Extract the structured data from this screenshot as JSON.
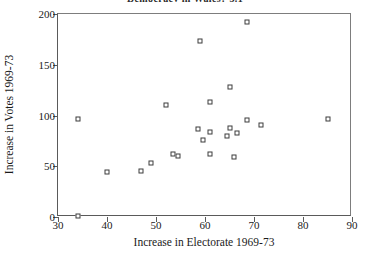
{
  "chart_data": {
    "type": "scatter",
    "title": "Democracy in Wales? 3.1",
    "xlabel": "Increase in Electorate 1969-73",
    "ylabel": "Increase in Votes 1969-73",
    "xlim": [
      30,
      90
    ],
    "ylim": [
      0,
      200
    ],
    "xticks": [
      30,
      40,
      50,
      60,
      70,
      80,
      90
    ],
    "yticks": [
      0,
      50,
      100,
      150,
      200
    ],
    "grid": false,
    "legend": null,
    "marker": "open-square",
    "marker_color": "#3c3c3c",
    "points": [
      {
        "x": 34,
        "y": 1
      },
      {
        "x": 34,
        "y": 97
      },
      {
        "x": 40,
        "y": 44
      },
      {
        "x": 47,
        "y": 45
      },
      {
        "x": 49,
        "y": 53
      },
      {
        "x": 52,
        "y": 110
      },
      {
        "x": 53.5,
        "y": 62
      },
      {
        "x": 54.5,
        "y": 60
      },
      {
        "x": 58.5,
        "y": 87
      },
      {
        "x": 59,
        "y": 173
      },
      {
        "x": 59.5,
        "y": 76
      },
      {
        "x": 61,
        "y": 113
      },
      {
        "x": 61,
        "y": 84
      },
      {
        "x": 61,
        "y": 62
      },
      {
        "x": 64.5,
        "y": 80
      },
      {
        "x": 65,
        "y": 88
      },
      {
        "x": 65,
        "y": 128
      },
      {
        "x": 66,
        "y": 59
      },
      {
        "x": 66.5,
        "y": 83
      },
      {
        "x": 68.5,
        "y": 192
      },
      {
        "x": 68.5,
        "y": 96
      },
      {
        "x": 71.5,
        "y": 91
      },
      {
        "x": 85,
        "y": 97
      }
    ]
  }
}
